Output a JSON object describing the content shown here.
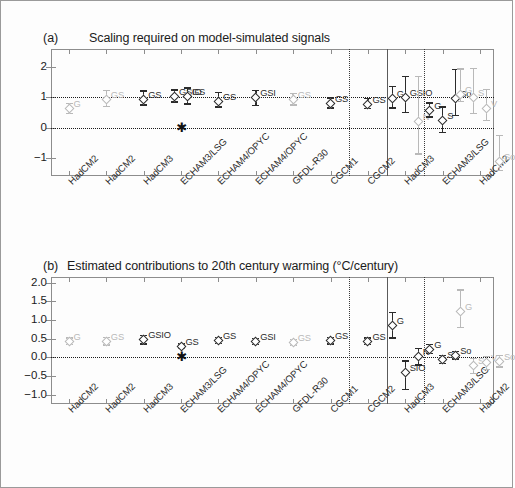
{
  "figure": {
    "border_color": "#9a9a9a",
    "background": "#ffffff"
  },
  "chart_data": [
    {
      "type": "scatter",
      "panel_tag": "(a)",
      "title": "Scaling required on model-simulated signals",
      "xlabel": "",
      "ylabel": "",
      "ylim": [
        -1.6,
        2.6
      ],
      "yticks": [
        2,
        1,
        0,
        -1
      ],
      "ytick_labels": [
        "2",
        "1",
        "0",
        "-1"
      ],
      "grid": "horizontal dotted at y=1 and y=0",
      "legend": "none",
      "zero_reference_marker": {
        "symbol": "asterisk",
        "x_category_index": 3,
        "y": 0.0
      },
      "group_separators_after_category": [
        7,
        8,
        9
      ],
      "categories": [
        "HadCM2",
        "HadCM2",
        "HadCM3",
        "ECHAM3/LSG",
        "ECHAM4/OPYC",
        "ECHAM4/OPYC",
        "GFDL-R30",
        "CGCM1",
        "CGCM2",
        "HadCM3",
        "ECHAM3/LSG",
        "HadCM2"
      ],
      "points": [
        {
          "cat": 0,
          "label": "G",
          "value": 0.62,
          "low": 0.44,
          "high": 0.82,
          "shade": "light"
        },
        {
          "cat": 1,
          "label": "GS",
          "value": 0.92,
          "low": 0.68,
          "high": 1.26,
          "shade": "light"
        },
        {
          "cat": 2,
          "label": "GS",
          "value": 0.93,
          "low": 0.73,
          "high": 1.24,
          "shade": "dark"
        },
        {
          "cat": 3,
          "label": "GSIO",
          "value": 1.03,
          "low": 0.82,
          "high": 1.27,
          "shade": "dark"
        },
        {
          "cat": 3,
          "label": "GS",
          "value": 1.02,
          "low": 0.76,
          "high": 1.33,
          "shade": "dark"
        },
        {
          "cat": 4,
          "label": "GS",
          "value": 0.85,
          "low": 0.66,
          "high": 1.18,
          "shade": "dark"
        },
        {
          "cat": 5,
          "label": "GSI",
          "value": 0.99,
          "low": 0.71,
          "high": 1.25,
          "shade": "dark"
        },
        {
          "cat": 6,
          "label": "GS",
          "value": 0.92,
          "low": 0.72,
          "high": 1.16,
          "shade": "light"
        },
        {
          "cat": 7,
          "label": "GS",
          "value": 0.8,
          "low": 0.62,
          "high": 1.0,
          "shade": "dark"
        },
        {
          "cat": 8,
          "label": "GS",
          "value": 0.78,
          "low": 0.6,
          "high": 0.98,
          "shade": "dark"
        },
        {
          "cat": 9,
          "label": "G",
          "value": 0.97,
          "low": 0.62,
          "high": 1.38,
          "shade": "dark"
        },
        {
          "cat": 9,
          "label": "GSIO",
          "value": 0.98,
          "low": 0.48,
          "high": 1.72,
          "shade": "dark"
        },
        {
          "cat": 9,
          "label": "N",
          "value": 0.2,
          "low": -0.9,
          "high": 1.72,
          "shade": "light"
        },
        {
          "cat": 10,
          "label": "G",
          "value": 0.58,
          "low": 0.33,
          "high": 0.84,
          "shade": "dark"
        },
        {
          "cat": 10,
          "label": "S",
          "value": 0.22,
          "low": -0.18,
          "high": 0.7,
          "shade": "dark"
        },
        {
          "cat": 10,
          "label": "So",
          "value": 0.97,
          "low": 0.38,
          "high": 1.95,
          "shade": "dark"
        },
        {
          "cat": 11,
          "label": "G",
          "value": 1.1,
          "low": 0.84,
          "high": 1.96,
          "shade": "light"
        },
        {
          "cat": 11,
          "label": "S",
          "value": 1.0,
          "low": 0.45,
          "high": 1.98,
          "shade": "light"
        },
        {
          "cat": 11,
          "label": "V",
          "value": 0.62,
          "low": 0.22,
          "high": 1.28,
          "shade": "light"
        },
        {
          "cat": 11,
          "label": "So",
          "value": -1.12,
          "low": -1.45,
          "high": -0.24,
          "shade": "light"
        }
      ]
    },
    {
      "type": "scatter",
      "panel_tag": "(b)",
      "title": "Estimated contributions to 20th century warming (°C/century)",
      "xlabel": "",
      "ylabel": "",
      "ylim": [
        -1.25,
        2.15
      ],
      "yticks": [
        2.0,
        1.5,
        1.0,
        0.5,
        0.0,
        -0.5,
        -1.0
      ],
      "ytick_labels": [
        "2.0",
        "1.5",
        "1.0",
        "0.5",
        "0.0",
        "-0.5",
        "-1.0"
      ],
      "grid": "horizontal dotted at y=0.0",
      "legend": "none",
      "zero_reference_marker": {
        "symbol": "asterisk",
        "x_category_index": 3,
        "y": 0.0
      },
      "group_separators_after_category": [
        7,
        8,
        9
      ],
      "categories": [
        "HadCM2",
        "HadCM2",
        "HadCM3",
        "ECHAM3/LSG",
        "ECHAM4/OPYC",
        "ECHAM4/OPYC",
        "GFDL-R30",
        "CGCM1",
        "CGCM2",
        "HadCM3",
        "ECHAM3/LSG",
        "HadCM2"
      ],
      "points": [
        {
          "cat": 0,
          "label": "G",
          "value": 0.42,
          "low": 0.32,
          "high": 0.54,
          "shade": "light"
        },
        {
          "cat": 1,
          "label": "GS",
          "value": 0.42,
          "low": 0.31,
          "high": 0.55,
          "shade": "light"
        },
        {
          "cat": 2,
          "label": "GSIO",
          "value": 0.47,
          "low": 0.34,
          "high": 0.6,
          "shade": "dark"
        },
        {
          "cat": 3,
          "label": "GS",
          "value": 0.3,
          "low": 0.23,
          "high": 0.38,
          "shade": "dark"
        },
        {
          "cat": 4,
          "label": "GS",
          "value": 0.44,
          "low": 0.35,
          "high": 0.55,
          "shade": "dark"
        },
        {
          "cat": 5,
          "label": "GSI",
          "value": 0.41,
          "low": 0.32,
          "high": 0.52,
          "shade": "dark"
        },
        {
          "cat": 6,
          "label": "GS",
          "value": 0.4,
          "low": 0.31,
          "high": 0.5,
          "shade": "light"
        },
        {
          "cat": 7,
          "label": "GS",
          "value": 0.44,
          "low": 0.34,
          "high": 0.55,
          "shade": "dark"
        },
        {
          "cat": 8,
          "label": "GS",
          "value": 0.43,
          "low": 0.33,
          "high": 0.54,
          "shade": "dark"
        },
        {
          "cat": 9,
          "label": "G",
          "value": 0.86,
          "low": 0.5,
          "high": 1.22,
          "shade": "dark"
        },
        {
          "cat": 9,
          "label": "SIO",
          "value": -0.42,
          "low": -0.88,
          "high": -0.08,
          "shade": "dark"
        },
        {
          "cat": 9,
          "label": "N",
          "value": 0.02,
          "low": -0.22,
          "high": 0.26,
          "shade": "dark"
        },
        {
          "cat": 10,
          "label": "G",
          "value": 0.22,
          "low": 0.08,
          "high": 0.36,
          "shade": "dark"
        },
        {
          "cat": 10,
          "label": "S",
          "value": -0.06,
          "low": -0.18,
          "high": 0.06,
          "shade": "dark"
        },
        {
          "cat": 10,
          "label": "So",
          "value": 0.04,
          "low": -0.06,
          "high": 0.17,
          "shade": "dark"
        },
        {
          "cat": 11,
          "label": "G",
          "value": 1.22,
          "low": 0.78,
          "high": 1.82,
          "shade": "light"
        },
        {
          "cat": 11,
          "label": "S",
          "value": -0.22,
          "low": -0.46,
          "high": -0.02,
          "shade": "light"
        },
        {
          "cat": 11,
          "label": "V",
          "value": -0.14,
          "low": -0.34,
          "high": 0.04,
          "shade": "light"
        },
        {
          "cat": 11,
          "label": "So",
          "value": -0.1,
          "low": -0.28,
          "high": 0.06,
          "shade": "light"
        }
      ]
    }
  ]
}
